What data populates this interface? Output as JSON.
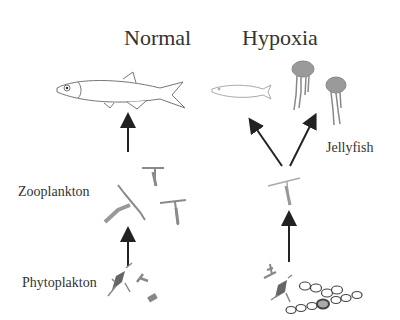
{
  "diagram": {
    "panels": [
      {
        "title": "Normal",
        "labels": {
          "zooplankton": "Zooplankton",
          "phytoplankton": "Phytoplakton"
        }
      },
      {
        "title": "Hypoxia",
        "labels": {
          "jellyfish": "Jellyfish"
        }
      }
    ],
    "icons": [
      "fish-icon",
      "zooplankton-icon",
      "phytoplankton-icon",
      "jellyfish-icon",
      "diatom-chain-icon",
      "arrow-up-icon"
    ],
    "colors": {
      "text": "#333333",
      "arrow": "#222222",
      "organism": "#8a8a8a",
      "outline": "#666666"
    }
  }
}
